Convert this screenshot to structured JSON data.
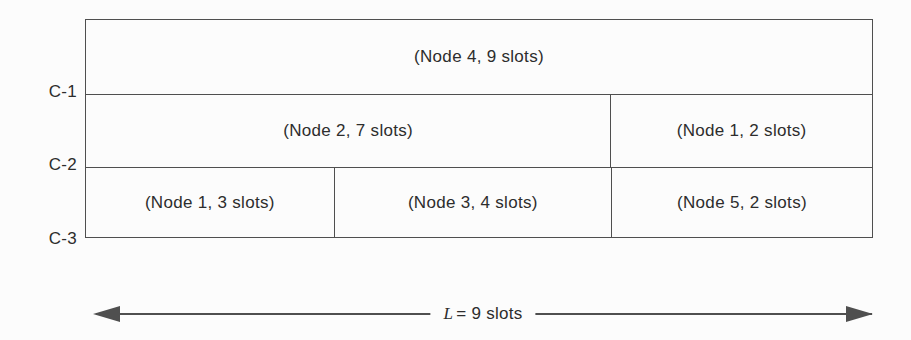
{
  "diagram": {
    "title_hint": "slot-allocation-schedule",
    "channel_labels": [
      {
        "label": "C-1"
      },
      {
        "label": "C-2"
      },
      {
        "label": "C-3"
      }
    ],
    "rows": [
      {
        "channel": "C-1",
        "cells": [
          {
            "node": "Node 4",
            "slots": 9,
            "label": "(Node 4, 9 slots)"
          }
        ]
      },
      {
        "channel": "C-2",
        "cells": [
          {
            "node": "Node 2",
            "slots": 7,
            "label": "(Node 2, 7 slots)"
          },
          {
            "node": "Node 1",
            "slots": 2,
            "label": "(Node 1, 2 slots)"
          }
        ]
      },
      {
        "channel": "C-3",
        "cells": [
          {
            "node": "Node 1",
            "slots": 3,
            "label": "(Node 1, 3 slots)"
          },
          {
            "node": "Node 3",
            "slots": 4,
            "label": "(Node 3, 4 slots)"
          },
          {
            "node": "Node 5",
            "slots": 2,
            "label": "(Node 5, 2 slots)"
          }
        ]
      }
    ],
    "length_arrow": {
      "label_var": "L",
      "label_rest": "= 9 slots",
      "total_slots": 9
    },
    "colors": {
      "line": "#4f4f4f",
      "text": "#2d2d2d",
      "background": "#fcfcfc"
    }
  }
}
